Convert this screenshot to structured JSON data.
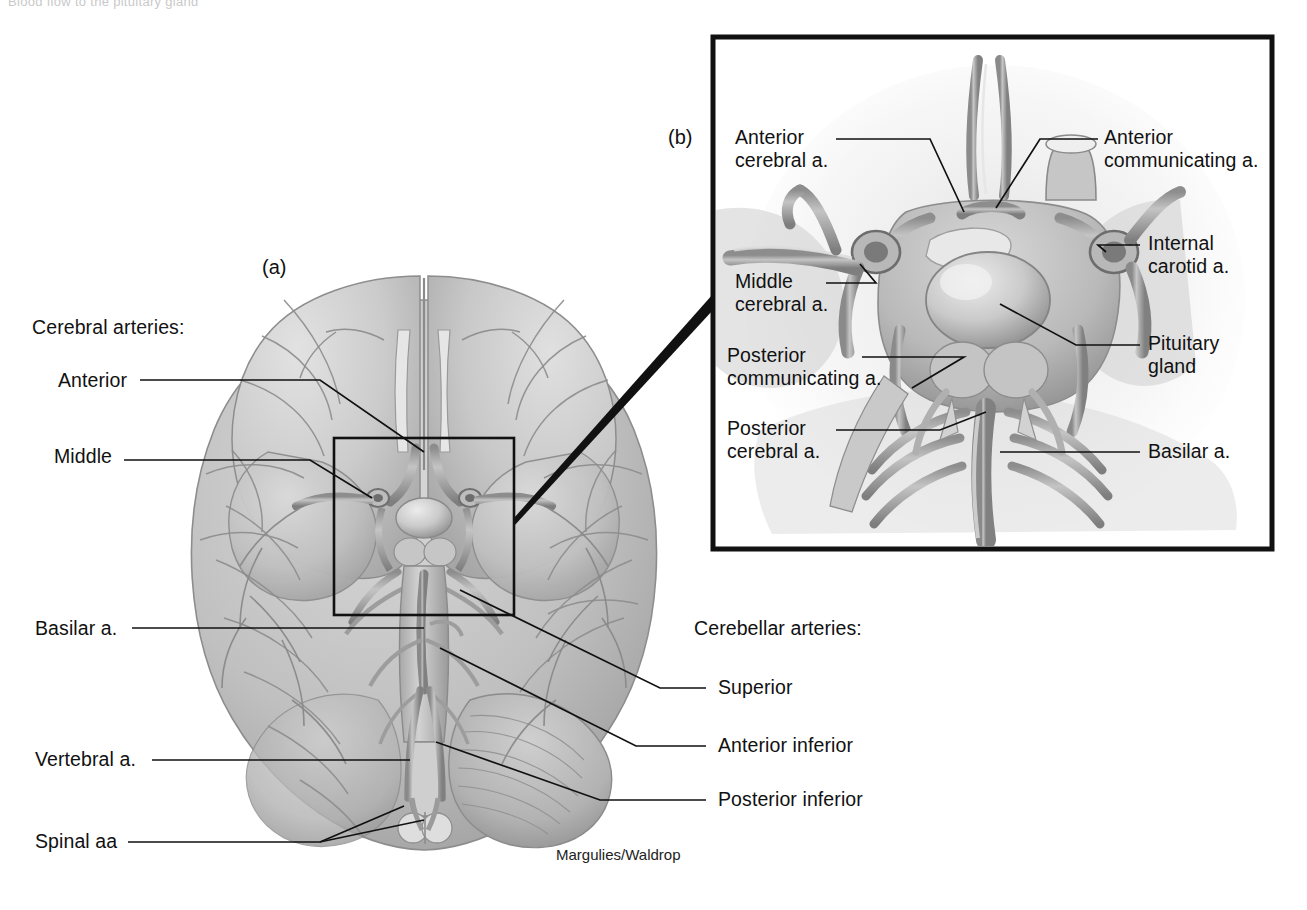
{
  "figure": {
    "title_cut": "Blood flow to the pituitary gland",
    "credit": "Margulies/Waldrop",
    "background": "#ffffff",
    "line_color": "#111111",
    "tissue_light": "#d5d5d5",
    "tissue_mid": "#b4b4b4",
    "tissue_dark": "#8f8f8f",
    "vessel_gray": "#9a9a9a"
  },
  "panel_a": {
    "id": "(a)",
    "caption_group_left": "Cerebral arteries:",
    "caption_group_right": "Cerebellar arteries:",
    "labels": [
      {
        "text": "Cerebral arteries:",
        "side": "left"
      },
      {
        "text": "Anterior",
        "side": "left"
      },
      {
        "text": "Middle",
        "side": "left"
      },
      {
        "text": "Basilar a.",
        "side": "left"
      },
      {
        "text": "Vertebral a.",
        "side": "left"
      },
      {
        "text": "Spinal aa",
        "side": "left"
      },
      {
        "text": "Cerebellar arteries:",
        "side": "right"
      },
      {
        "text": "Superior",
        "side": "right"
      },
      {
        "text": "Anterior inferior",
        "side": "right"
      },
      {
        "text": "Posterior inferior",
        "side": "right"
      }
    ],
    "inset_box": {
      "x": 334,
      "y": 438,
      "w": 180,
      "h": 177
    }
  },
  "panel_b": {
    "id": "(b)",
    "box": {
      "x": 713,
      "y": 37,
      "w": 559,
      "h": 512
    },
    "labels": [
      {
        "text": "Anterior\ncerebral a.",
        "side": "left"
      },
      {
        "text": "Middle\ncerebral a.",
        "side": "left"
      },
      {
        "text": "Posterior\ncommunicating a.",
        "side": "left"
      },
      {
        "text": "Posterior\ncerebral a.",
        "side": "left"
      },
      {
        "text": "Anterior\ncommunicating a.",
        "side": "right"
      },
      {
        "text": "Internal\ncarotid a.",
        "side": "right"
      },
      {
        "text": "Pituitary\ngland",
        "side": "right"
      },
      {
        "text": "Basilar a.",
        "side": "right"
      }
    ]
  }
}
